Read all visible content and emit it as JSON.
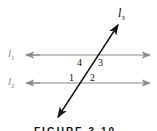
{
  "diagram": {
    "lines": [
      {
        "id": "l1",
        "label": "l",
        "subscript": "1",
        "color": "#8a8a8a"
      },
      {
        "id": "l2",
        "label": "l",
        "subscript": "2",
        "color": "#8a8a8a"
      },
      {
        "id": "l3",
        "label": "l",
        "subscript": "3",
        "color": "#111111"
      }
    ],
    "angles": [
      "1",
      "2",
      "3",
      "4"
    ],
    "caption": "FIGURE 3.10"
  }
}
